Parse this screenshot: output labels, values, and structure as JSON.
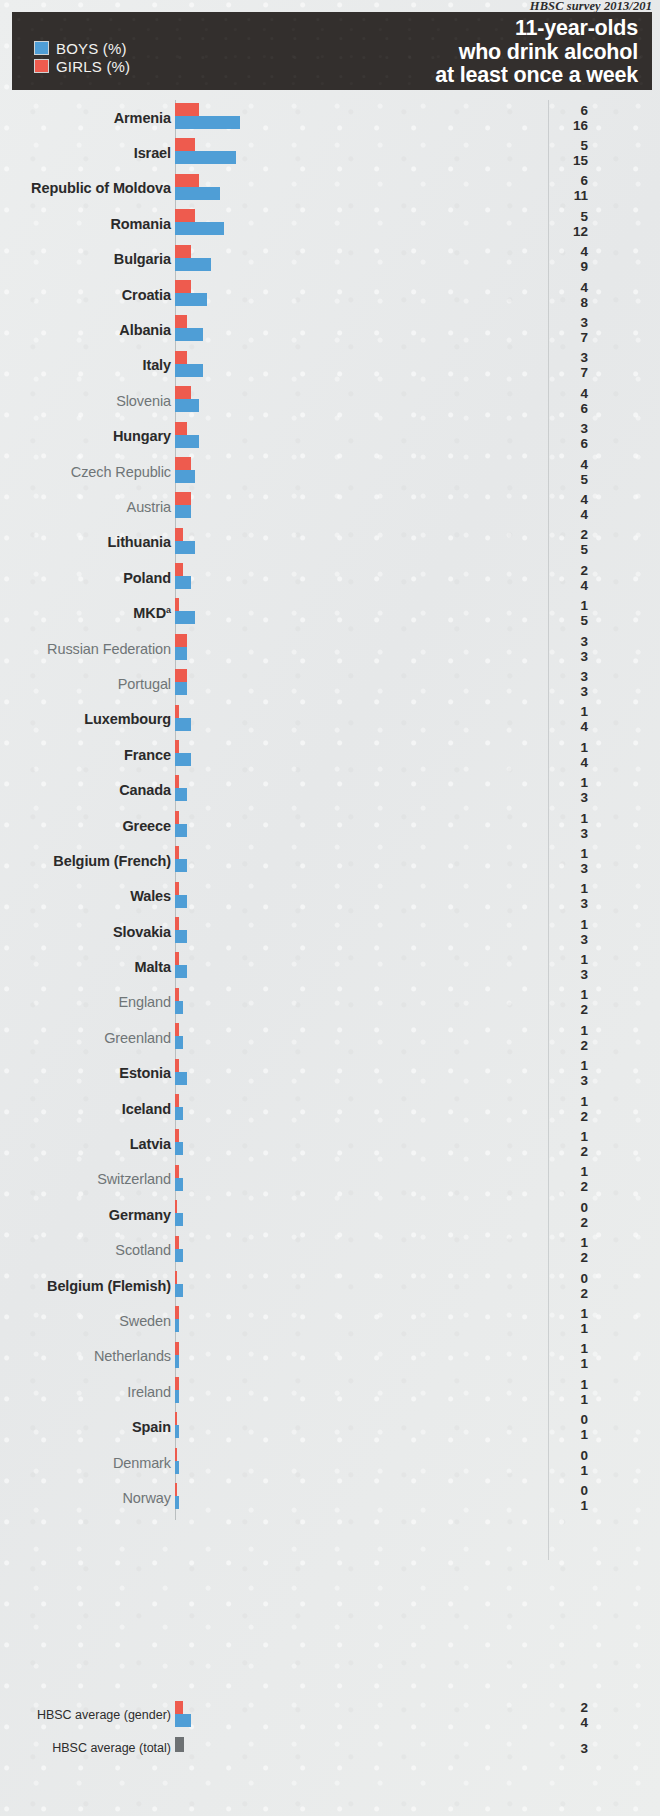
{
  "source_note": "HBSC survey 2013/201",
  "header": {
    "title_lines": [
      "11-year-olds",
      "who drink alcohol",
      "at least once a week"
    ],
    "legend": [
      {
        "label": "BOYS (%)",
        "color": "#4f9ed6",
        "key": "boys"
      },
      {
        "label": "GIRLS (%)",
        "color": "#ee5b4e",
        "key": "girls"
      }
    ]
  },
  "averages": [
    {
      "label": "HBSC average (gender)",
      "girls": 2,
      "boys": 4,
      "type": "gender"
    },
    {
      "label": "HBSC average (total)",
      "total": 3,
      "type": "total"
    }
  ],
  "colors": {
    "boys": "#4f9ed6",
    "girls": "#ee5b4e",
    "total": "#6d7173",
    "header_band": "#332f2d",
    "page_background": "#e9ebeb",
    "label_bold": "#2a2a2a",
    "label_light": "#6f7577"
  },
  "chart_data": {
    "type": "bar",
    "title": "11-year-olds who drink alcohol at least once a week",
    "subtitle": "HBSC survey 2013/201",
    "orientation": "horizontal",
    "grid": false,
    "legend_position": "top-left",
    "xlabel": "",
    "ylabel": "",
    "xlim": [
      0,
      16
    ],
    "unit": "%",
    "value_label_note": "Top number = girls (red), bottom number = boys (blue)",
    "categories": [
      "Armenia",
      "Israel",
      "Republic of Moldova",
      "Romania",
      "Bulgaria",
      "Croatia",
      "Albania",
      "Italy",
      "Slovenia",
      "Hungary",
      "Czech Republic",
      "Austria",
      "Lithuania",
      "Poland",
      "MKD",
      "Russian Federation",
      "Portugal",
      "Luxembourg",
      "France",
      "Canada",
      "Greece",
      "Belgium (French)",
      "Wales",
      "Slovakia",
      "Malta",
      "England",
      "Greenland",
      "Estonia",
      "Iceland",
      "Latvia",
      "Switzerland",
      "Germany",
      "Scotland",
      "Belgium (Flemish)",
      "Sweden",
      "Netherlands",
      "Ireland",
      "Spain",
      "Denmark",
      "Norway"
    ],
    "series": [
      {
        "name": "GIRLS (%)",
        "color": "#ee5b4e",
        "values": [
          6,
          5,
          6,
          5,
          4,
          4,
          3,
          3,
          4,
          3,
          4,
          4,
          2,
          2,
          1,
          3,
          3,
          1,
          1,
          1,
          1,
          1,
          1,
          1,
          1,
          1,
          1,
          1,
          1,
          1,
          1,
          0,
          1,
          0,
          1,
          1,
          1,
          0,
          0,
          0
        ]
      },
      {
        "name": "BOYS (%)",
        "color": "#4f9ed6",
        "values": [
          16,
          15,
          11,
          12,
          9,
          8,
          7,
          7,
          6,
          6,
          5,
          4,
          5,
          4,
          5,
          3,
          3,
          4,
          4,
          3,
          3,
          3,
          3,
          3,
          3,
          2,
          2,
          3,
          2,
          2,
          2,
          2,
          2,
          2,
          1,
          1,
          1,
          1,
          1,
          1
        ]
      }
    ],
    "averages": {
      "girls": 2,
      "boys": 4,
      "total": 3
    }
  },
  "rows": [
    {
      "name": "Armenia",
      "bold": true,
      "girls": 6,
      "boys": 16
    },
    {
      "name": "Israel",
      "bold": true,
      "girls": 5,
      "boys": 15
    },
    {
      "name": "Republic of Moldova",
      "bold": true,
      "girls": 6,
      "boys": 11
    },
    {
      "name": "Romania",
      "bold": true,
      "girls": 5,
      "boys": 12
    },
    {
      "name": "Bulgaria",
      "bold": true,
      "girls": 4,
      "boys": 9
    },
    {
      "name": "Croatia",
      "bold": true,
      "girls": 4,
      "boys": 8
    },
    {
      "name": "Albania",
      "bold": true,
      "girls": 3,
      "boys": 7
    },
    {
      "name": "Italy",
      "bold": true,
      "girls": 3,
      "boys": 7
    },
    {
      "name": "Slovenia",
      "bold": false,
      "girls": 4,
      "boys": 6
    },
    {
      "name": "Hungary",
      "bold": true,
      "girls": 3,
      "boys": 6
    },
    {
      "name": "Czech Republic",
      "bold": false,
      "girls": 4,
      "boys": 5
    },
    {
      "name": "Austria",
      "bold": false,
      "girls": 4,
      "boys": 4
    },
    {
      "name": "Lithuania",
      "bold": true,
      "girls": 2,
      "boys": 5
    },
    {
      "name": "Poland",
      "bold": true,
      "girls": 2,
      "boys": 4
    },
    {
      "name": "MKD",
      "bold": true,
      "girls": 1,
      "boys": 5,
      "superscript": "a"
    },
    {
      "name": "Russian Federation",
      "bold": false,
      "girls": 3,
      "boys": 3
    },
    {
      "name": "Portugal",
      "bold": false,
      "girls": 3,
      "boys": 3
    },
    {
      "name": "Luxembourg",
      "bold": true,
      "girls": 1,
      "boys": 4
    },
    {
      "name": "France",
      "bold": true,
      "girls": 1,
      "boys": 4
    },
    {
      "name": "Canada",
      "bold": true,
      "girls": 1,
      "boys": 3
    },
    {
      "name": "Greece",
      "bold": true,
      "girls": 1,
      "boys": 3
    },
    {
      "name": "Belgium (French)",
      "bold": true,
      "girls": 1,
      "boys": 3
    },
    {
      "name": "Wales",
      "bold": true,
      "girls": 1,
      "boys": 3
    },
    {
      "name": "Slovakia",
      "bold": true,
      "girls": 1,
      "boys": 3
    },
    {
      "name": "Malta",
      "bold": true,
      "girls": 1,
      "boys": 3
    },
    {
      "name": "England",
      "bold": false,
      "girls": 1,
      "boys": 2
    },
    {
      "name": "Greenland",
      "bold": false,
      "girls": 1,
      "boys": 2
    },
    {
      "name": "Estonia",
      "bold": true,
      "girls": 1,
      "boys": 3
    },
    {
      "name": "Iceland",
      "bold": true,
      "girls": 1,
      "boys": 2
    },
    {
      "name": "Latvia",
      "bold": true,
      "girls": 1,
      "boys": 2
    },
    {
      "name": "Switzerland",
      "bold": false,
      "girls": 1,
      "boys": 2
    },
    {
      "name": "Germany",
      "bold": true,
      "girls": 0,
      "boys": 2
    },
    {
      "name": "Scotland",
      "bold": false,
      "girls": 1,
      "boys": 2
    },
    {
      "name": "Belgium (Flemish)",
      "bold": true,
      "girls": 0,
      "boys": 2
    },
    {
      "name": "Sweden",
      "bold": false,
      "girls": 1,
      "boys": 1
    },
    {
      "name": "Netherlands",
      "bold": false,
      "girls": 1,
      "boys": 1
    },
    {
      "name": "Ireland",
      "bold": false,
      "girls": 1,
      "boys": 1
    },
    {
      "name": "Spain",
      "bold": true,
      "girls": 0,
      "boys": 1
    },
    {
      "name": "Denmark",
      "bold": false,
      "girls": 0,
      "boys": 1
    },
    {
      "name": "Norway",
      "bold": false,
      "girls": 0,
      "boys": 1
    }
  ]
}
